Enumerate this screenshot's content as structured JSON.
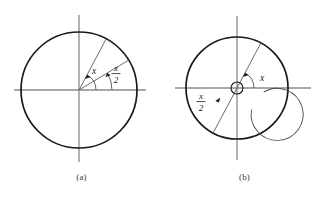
{
  "figure": {
    "background_color": "#ffffff",
    "stroke_color": "#1a1a1a",
    "axis_color": "#8a8a8a",
    "ray_color": "#555555",
    "panels": [
      {
        "id": "a",
        "caption": "(a)",
        "center": {
          "x": 79,
          "y": 90
        },
        "circle": {
          "radius": 58,
          "stroke_width": 1.6
        },
        "axes": {
          "horizontal": {
            "x1": 14,
            "y1": 90,
            "x2": 146,
            "y2": 90
          },
          "vertical": {
            "x1": 79,
            "y1": 15,
            "x2": 79,
            "y2": 162
          }
        },
        "rays": [
          {
            "name": "ray-x",
            "angle_deg": 62,
            "length": 58
          },
          {
            "name": "ray-x-half",
            "angle_deg": 31,
            "length": 58
          }
        ],
        "angle_arcs": [
          {
            "name": "arc-x",
            "label": "x",
            "from_deg": 0,
            "to_deg": 62,
            "radius": 17,
            "label_pos": {
              "x": 90,
              "y": 75
            }
          },
          {
            "name": "arc-x-half",
            "label_numerator": "x",
            "label_denominator": "2",
            "from_deg": 0,
            "to_deg": 31,
            "radius": 33,
            "label_pos": {
              "x": 112,
              "y": 74
            }
          }
        ]
      },
      {
        "id": "b",
        "caption": "(b)",
        "center": {
          "x": 74,
          "y": 88
        },
        "circle": {
          "radius": 51,
          "stroke_width": 1.6
        },
        "inner_small_circle": {
          "radius": 6
        },
        "spiral_arc": {
          "radius": 26,
          "from_deg": 62,
          "to_deg": 250
        },
        "axes": {
          "horizontal": {
            "x1": 12,
            "y1": 88,
            "x2": 148,
            "y2": 88
          },
          "vertical": {
            "x1": 74,
            "y1": 16,
            "x2": 74,
            "y2": 160
          }
        },
        "rays": [
          {
            "name": "ray-x",
            "angle_deg": 62,
            "length": 51
          },
          {
            "name": "ray-x-half",
            "angle_deg": 242,
            "length": 51
          }
        ],
        "angle_arcs": [
          {
            "name": "arc-x",
            "label": "x",
            "from_deg": 0,
            "to_deg": 62,
            "radius": 17,
            "label_pos": {
              "x": 99,
              "y": 83
            }
          },
          {
            "name": "arc-x-half",
            "label_numerator": "x",
            "label_denominator": "2",
            "label_pos": {
              "x": 36,
              "y": 98
            }
          }
        ]
      }
    ],
    "labels": {
      "x": "x",
      "x_over_2_numerator": "x",
      "x_over_2_denominator": "2"
    }
  }
}
